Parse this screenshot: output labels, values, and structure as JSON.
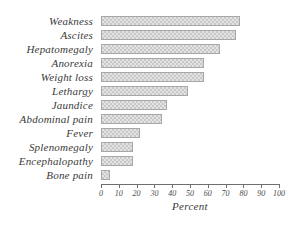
{
  "chart_data": {
    "type": "bar",
    "orientation": "horizontal",
    "title": "",
    "subtitle": "",
    "xlabel": "Percent",
    "ylabel": "",
    "xlim": [
      0,
      100
    ],
    "grid": false,
    "legend": null,
    "xticks": [
      "0",
      "10",
      "20",
      "30",
      "40",
      "50",
      "60",
      "70",
      "80",
      "90",
      "100"
    ],
    "xtick_values": [
      0,
      10,
      20,
      30,
      40,
      50,
      60,
      70,
      80,
      90,
      100
    ],
    "categories": [
      "Weakness",
      "Ascites",
      "Hepatomegaly",
      "Anorexia",
      "Weight loss",
      "Lethargy",
      "Jaundice",
      "Abdominal pain",
      "Fever",
      "Splenomegaly",
      "Encephalopathy",
      "Bone pain"
    ],
    "values": [
      78,
      76,
      67,
      58,
      58,
      49,
      37,
      34,
      22,
      18,
      18,
      5
    ],
    "bar_fill_color": "#e3e3e3",
    "bar_pattern_color": "#c9c9c9",
    "bar_border_color": "#a8a8a8",
    "axis_color": "#6f6f6f",
    "background_color": "#ffffff"
  }
}
